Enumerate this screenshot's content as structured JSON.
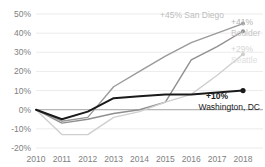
{
  "chart_data": {
    "type": "line",
    "title": "",
    "subtitle": "",
    "xlabel": "",
    "ylabel": "",
    "x": [
      2010,
      2011,
      2012,
      2013,
      2014,
      2015,
      2016,
      2017,
      2018
    ],
    "xtick_labels": [
      "2010",
      "2011",
      "2012",
      "2013",
      "2014",
      "2015",
      "2016",
      "2017",
      "2018"
    ],
    "ytick_labels": [
      "50%",
      "40%",
      "30%",
      "20%",
      "10%",
      "0%",
      "-10%",
      "-20%"
    ],
    "ytick_values": [
      50,
      40,
      30,
      20,
      10,
      0,
      -10,
      -20
    ],
    "ylim": [
      -20,
      50
    ],
    "xlim": [
      2010,
      2018
    ],
    "grid": true,
    "legend_position": "inline-end-labels",
    "series": [
      {
        "name": "San Diego",
        "values": [
          0,
          -6,
          -4,
          12,
          20,
          28,
          35,
          40,
          45
        ],
        "end_value_label": "+45%",
        "color": "#9a9a9a",
        "width": 1.4,
        "marker_end": true
      },
      {
        "name": "Boulder",
        "values": [
          0,
          -7,
          -5,
          -2,
          0,
          4,
          26,
          33,
          41
        ],
        "end_value_label": "+41%",
        "color": "#8f8f8f",
        "width": 1.4,
        "marker_end": true
      },
      {
        "name": "Seattle",
        "values": [
          0,
          -13,
          -13,
          -4,
          -1,
          4,
          8,
          18,
          29
        ],
        "end_value_label": "+29%",
        "color": "#cfcfcf",
        "width": 1.4,
        "marker_end": true
      },
      {
        "name": "Washington, DC",
        "values": [
          0,
          -5,
          -1,
          6,
          7,
          8,
          8,
          9,
          10
        ],
        "end_value_label": "+10%",
        "color": "#1a1a1a",
        "width": 2.0,
        "marker_end": true
      }
    ],
    "annotations": [
      {
        "id": "san-diego",
        "pct": "+45%",
        "city": "San Diego",
        "color": "#bdbdbd"
      },
      {
        "id": "boulder",
        "pct": "+41%",
        "city": "Boulder",
        "color": "#bdbdbd"
      },
      {
        "id": "seattle",
        "pct": "+29%",
        "city": "Seattle",
        "color": "#dcdcdc"
      },
      {
        "id": "washington",
        "pct": "+10%",
        "city": "Washington, DC",
        "color": "#1a1a1a"
      }
    ]
  }
}
